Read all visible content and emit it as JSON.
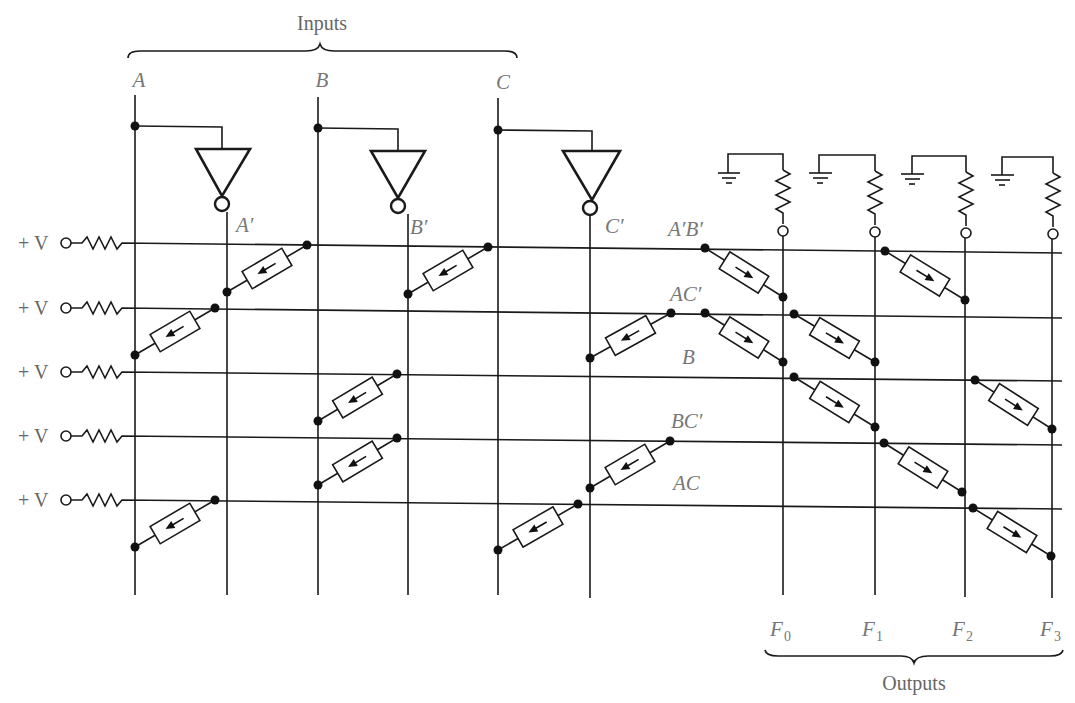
{
  "title_inputs": "Inputs",
  "title_outputs": "Outputs",
  "supply_label": "+ V",
  "inputs": [
    {
      "name": "A",
      "x": 135,
      "inv_label": "A′",
      "inv_x": 227,
      "bracket_top": 95
    },
    {
      "name": "B",
      "x": 318,
      "inv_label": "B′",
      "inv_x": 408
    },
    {
      "name": "C",
      "x": 498,
      "inv_label": "C′",
      "inv_x": 590
    }
  ],
  "rows": [
    {
      "term": "A′B′",
      "y_left": 243,
      "y_right": 253
    },
    {
      "term": "AC′",
      "y_left": 308,
      "y_right": 318
    },
    {
      "term": "B",
      "y_left": 372,
      "y_right": 381
    },
    {
      "term": "BC′",
      "y_left": 436,
      "y_right": 445
    },
    {
      "term": "AC",
      "y_left": 500,
      "y_right": 509
    }
  ],
  "outputs": [
    {
      "name": "F",
      "sub": "0",
      "x": 783
    },
    {
      "name": "F",
      "sub": "1",
      "x": 875
    },
    {
      "name": "F",
      "sub": "2",
      "x": 965
    },
    {
      "name": "F",
      "sub": "3",
      "x": 1052
    }
  ],
  "and_diodes": [
    {
      "row": 0,
      "col": "A′",
      "from": [
        307,
        245
      ],
      "to": [
        227,
        292
      ]
    },
    {
      "row": 0,
      "col": "B′",
      "from": [
        488,
        247
      ],
      "to": [
        408,
        294
      ]
    },
    {
      "row": 1,
      "col": "A",
      "from": [
        215,
        308
      ],
      "to": [
        135,
        355
      ]
    },
    {
      "row": 1,
      "col": "C′",
      "from": [
        671,
        313
      ],
      "to": [
        590,
        358
      ]
    },
    {
      "row": 2,
      "col": "B",
      "from": [
        397,
        374
      ],
      "to": [
        318,
        421
      ]
    },
    {
      "row": 3,
      "col": "B",
      "from": [
        397,
        438
      ],
      "to": [
        318,
        485
      ]
    },
    {
      "row": 3,
      "col": "C′",
      "from": [
        670,
        441
      ],
      "to": [
        590,
        488
      ]
    },
    {
      "row": 4,
      "col": "A",
      "from": [
        215,
        500
      ],
      "to": [
        135,
        547
      ]
    },
    {
      "row": 4,
      "col": "C",
      "from": [
        578,
        504
      ],
      "to": [
        498,
        550
      ]
    }
  ],
  "or_diodes": [
    {
      "row": 0,
      "out": "F0",
      "from": [
        705,
        248
      ],
      "to": [
        783,
        297
      ]
    },
    {
      "row": 0,
      "out": "F2",
      "from": [
        885,
        251
      ],
      "to": [
        965,
        300
      ]
    },
    {
      "row": 1,
      "out": "F0",
      "from": [
        705,
        313
      ],
      "to": [
        783,
        362
      ]
    },
    {
      "row": 1,
      "out": "F1",
      "from": [
        794,
        314
      ],
      "to": [
        875,
        362
      ]
    },
    {
      "row": 2,
      "out": "F1",
      "from": [
        794,
        377
      ],
      "to": [
        875,
        427
      ]
    },
    {
      "row": 2,
      "out": "F3",
      "from": [
        975,
        380
      ],
      "to": [
        1052,
        429
      ]
    },
    {
      "row": 3,
      "out": "F2",
      "from": [
        884,
        443
      ],
      "to": [
        962,
        492
      ]
    },
    {
      "row": 4,
      "out": "F3",
      "from": [
        973,
        508
      ],
      "to": [
        1051,
        556
      ]
    }
  ],
  "colors": {
    "line": "#1a1a1a",
    "label": "#777777"
  }
}
